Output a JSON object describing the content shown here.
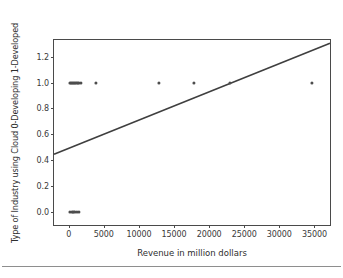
{
  "chart_data": {
    "type": "scatter",
    "title": "",
    "xlabel": "Revenue in million dollars",
    "ylabel": "Type of Industry using Cloud 0-Developing 1-Developed",
    "xlim": [
      -2100,
      37500
    ],
    "ylim": [
      -0.12,
      1.33
    ],
    "grid": false,
    "legend": null,
    "x_ticks": [
      0,
      5000,
      10000,
      15000,
      20000,
      25000,
      30000,
      35000
    ],
    "x_ticklabels": [
      "0",
      "5000",
      "10000",
      "15000",
      "20000",
      "25000",
      "30000",
      "35000"
    ],
    "y_ticks": [
      0.0,
      0.2,
      0.4,
      0.6,
      0.8,
      1.0,
      1.2
    ],
    "y_ticklabels": [
      "0.0",
      "0.2",
      "0.4",
      "0.6",
      "0.8",
      "1.0",
      "1.2"
    ],
    "marker_color": "#4d4d4d",
    "line_color": "#3f3f3f",
    "axes_color": "#4a4a4a",
    "background_color": "#ffffff",
    "series": [
      {
        "name": "observations",
        "type": "scatter",
        "points": [
          {
            "x": 150,
            "y": 1.0
          },
          {
            "x": 320,
            "y": 1.0
          },
          {
            "x": 480,
            "y": 1.0
          },
          {
            "x": 620,
            "y": 1.0
          },
          {
            "x": 780,
            "y": 1.0
          },
          {
            "x": 930,
            "y": 1.0
          },
          {
            "x": 1080,
            "y": 1.0
          },
          {
            "x": 1250,
            "y": 1.0
          },
          {
            "x": 1500,
            "y": 1.0
          },
          {
            "x": 1750,
            "y": 1.0
          },
          {
            "x": 3900,
            "y": 1.0
          },
          {
            "x": 12800,
            "y": 1.0
          },
          {
            "x": 17800,
            "y": 1.0
          },
          {
            "x": 22900,
            "y": 1.0
          },
          {
            "x": 34600,
            "y": 1.0
          },
          {
            "x": 180,
            "y": 0.0
          },
          {
            "x": 400,
            "y": 0.0
          },
          {
            "x": 600,
            "y": 0.0
          },
          {
            "x": 820,
            "y": 0.0
          },
          {
            "x": 1150,
            "y": 0.0
          },
          {
            "x": 1400,
            "y": 0.0
          }
        ]
      },
      {
        "name": "regression-line",
        "type": "line",
        "x_start": -2100,
        "y_start": 0.435,
        "x_end": 37500,
        "y_end": 1.305
      }
    ]
  }
}
